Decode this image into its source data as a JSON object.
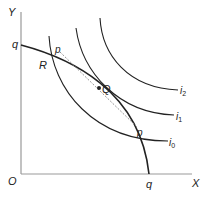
{
  "axes": {
    "y_label": "Y",
    "x_label": "X",
    "origin_label": "O"
  },
  "ppf": {
    "label_top": "q",
    "label_bottom": "q"
  },
  "price_line": {
    "label_upper": "p",
    "label_lower": "p"
  },
  "points": {
    "R": "R",
    "Q": "Q"
  },
  "indifference_curves": [
    {
      "name": "i",
      "sub": "0"
    },
    {
      "name": "i",
      "sub": "1"
    },
    {
      "name": "i",
      "sub": "2"
    }
  ],
  "colors": {
    "axis": "#999999",
    "curve": "#222222",
    "dashed": "#888888"
  }
}
